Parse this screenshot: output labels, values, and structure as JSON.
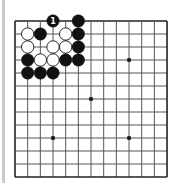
{
  "board": {
    "size": 13,
    "origin_x": 15,
    "origin_y": 21,
    "spacing_x": 12.67,
    "spacing_y": 13,
    "line_color": "#555555",
    "edge_color": "#222222",
    "background": "#ffffff",
    "star_points": [
      [
        3,
        9
      ],
      [
        6,
        6
      ],
      [
        9,
        3
      ],
      [
        9,
        9
      ]
    ],
    "stones": [
      {
        "col": 3,
        "row": 0,
        "color": "black",
        "label": "1"
      },
      {
        "col": 5,
        "row": 0,
        "color": "black"
      },
      {
        "col": 1,
        "row": 1,
        "color": "white"
      },
      {
        "col": 2,
        "row": 1,
        "color": "black"
      },
      {
        "col": 4,
        "row": 1,
        "color": "white"
      },
      {
        "col": 5,
        "row": 1,
        "color": "black"
      },
      {
        "col": 1,
        "row": 2,
        "color": "white"
      },
      {
        "col": 3,
        "row": 2,
        "color": "white"
      },
      {
        "col": 4,
        "row": 2,
        "color": "white"
      },
      {
        "col": 5,
        "row": 2,
        "color": "black"
      },
      {
        "col": 1,
        "row": 3,
        "color": "black"
      },
      {
        "col": 2,
        "row": 3,
        "color": "white"
      },
      {
        "col": 3,
        "row": 3,
        "color": "white"
      },
      {
        "col": 4,
        "row": 3,
        "color": "black"
      },
      {
        "col": 5,
        "row": 3,
        "color": "black"
      },
      {
        "col": 1,
        "row": 4,
        "color": "black"
      },
      {
        "col": 2,
        "row": 4,
        "color": "black"
      },
      {
        "col": 3,
        "row": 4,
        "color": "black"
      }
    ]
  }
}
